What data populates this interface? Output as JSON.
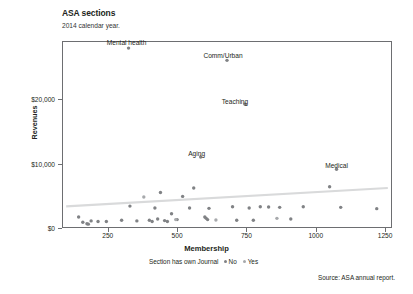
{
  "header": {
    "title": "ASA sections",
    "subtitle": "2014 calendar year."
  },
  "source_note": "Source: ASA annual report.",
  "legend": {
    "title": "Section has own Journal",
    "items": [
      {
        "label": "No",
        "color": "#808285"
      },
      {
        "label": "Yes",
        "color": "#a7a9ac"
      }
    ]
  },
  "colors": {
    "frame": "#6d6e71",
    "point_no": "#808285",
    "point_yes": "#a7a9ac",
    "trend": "#d9dadb",
    "text": "#231f20"
  },
  "chart_data": {
    "type": "scatter",
    "title": "ASA sections",
    "subtitle": "2014 calendar year.",
    "xlabel": "Membership",
    "ylabel": "Revenues",
    "xlim": [
      85,
      1275
    ],
    "ylim": [
      0,
      29000
    ],
    "xticks": [
      250,
      500,
      750,
      1000,
      1250
    ],
    "xticklabels": [
      "250",
      "500",
      "750",
      "1000",
      "1250"
    ],
    "yticks": [
      0,
      10000,
      20000
    ],
    "yticklabels": [
      "$0",
      "$10,000",
      "$20,000"
    ],
    "grid": false,
    "legend_position": "below-axis",
    "legend_title": "Section has own Journal",
    "series": [
      {
        "name": "No",
        "color": "#808285",
        "points": [
          {
            "x": 325,
            "y": 27900,
            "label": "Mental health"
          },
          {
            "x": 680,
            "y": 26000,
            "label": "Comm/Urban"
          },
          {
            "x": 745,
            "y": 19200,
            "label": "Teaching"
          },
          {
            "x": 585,
            "y": 11000,
            "label": "Aging"
          },
          {
            "x": 1075,
            "y": 9100,
            "label": "Medical"
          },
          {
            "x": 145,
            "y": 1700,
            "label": ""
          },
          {
            "x": 160,
            "y": 900,
            "label": ""
          },
          {
            "x": 175,
            "y": 650,
            "label": ""
          },
          {
            "x": 180,
            "y": 600,
            "label": ""
          },
          {
            "x": 190,
            "y": 1100,
            "label": ""
          },
          {
            "x": 215,
            "y": 1000,
            "label": ""
          },
          {
            "x": 245,
            "y": 1000,
            "label": ""
          },
          {
            "x": 300,
            "y": 1200,
            "label": ""
          },
          {
            "x": 330,
            "y": 3400,
            "label": ""
          },
          {
            "x": 355,
            "y": 1100,
            "label": ""
          },
          {
            "x": 400,
            "y": 1200,
            "label": ""
          },
          {
            "x": 410,
            "y": 1000,
            "label": ""
          },
          {
            "x": 420,
            "y": 3100,
            "label": ""
          },
          {
            "x": 430,
            "y": 1400,
            "label": ""
          },
          {
            "x": 440,
            "y": 5500,
            "label": ""
          },
          {
            "x": 455,
            "y": 1150,
            "label": ""
          },
          {
            "x": 465,
            "y": 1000,
            "label": ""
          },
          {
            "x": 480,
            "y": 2200,
            "label": ""
          },
          {
            "x": 500,
            "y": 1300,
            "label": ""
          },
          {
            "x": 520,
            "y": 4900,
            "label": ""
          },
          {
            "x": 545,
            "y": 3100,
            "label": ""
          },
          {
            "x": 560,
            "y": 6200,
            "label": ""
          },
          {
            "x": 600,
            "y": 1700,
            "label": ""
          },
          {
            "x": 605,
            "y": 1500,
            "label": ""
          },
          {
            "x": 610,
            "y": 1300,
            "label": ""
          },
          {
            "x": 615,
            "y": 3050,
            "label": ""
          },
          {
            "x": 700,
            "y": 3300,
            "label": ""
          },
          {
            "x": 715,
            "y": 1200,
            "label": ""
          },
          {
            "x": 760,
            "y": 3100,
            "label": ""
          },
          {
            "x": 775,
            "y": 1200,
            "label": ""
          },
          {
            "x": 800,
            "y": 3300,
            "label": ""
          },
          {
            "x": 830,
            "y": 3250,
            "label": ""
          },
          {
            "x": 870,
            "y": 3200,
            "label": ""
          },
          {
            "x": 910,
            "y": 1400,
            "label": ""
          },
          {
            "x": 955,
            "y": 3300,
            "label": ""
          },
          {
            "x": 1050,
            "y": 6400,
            "label": ""
          },
          {
            "x": 1090,
            "y": 3200,
            "label": ""
          },
          {
            "x": 1220,
            "y": 3000,
            "label": ""
          }
        ]
      },
      {
        "name": "Yes",
        "color": "#a7a9ac",
        "points": [
          {
            "x": 380,
            "y": 4800,
            "label": ""
          },
          {
            "x": 495,
            "y": 1300,
            "label": ""
          },
          {
            "x": 640,
            "y": 1250,
            "label": ""
          },
          {
            "x": 860,
            "y": 1500,
            "label": ""
          }
        ]
      }
    ],
    "trendline": {
      "x1": 100,
      "y1": 3350,
      "x2": 1260,
      "y2": 6200,
      "color": "#d9dadb"
    }
  }
}
